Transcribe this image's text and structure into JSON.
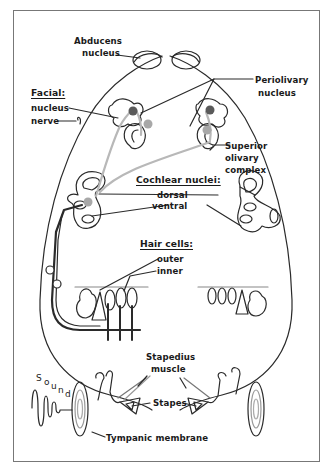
{
  "diagram": {
    "labels": {
      "abducens": [
        "Abducens",
        "nucleus"
      ],
      "facial_header": "Facial:",
      "facial_nucleus": "nucleus",
      "facial_nerve": "nerve",
      "periolivary": [
        "Periolivary",
        "nucleus"
      ],
      "superior_olivary": [
        "Superior",
        "olivary",
        "complex"
      ],
      "cochlear_header": "Cochlear nuclei:",
      "dorsal": "dorsal",
      "ventral": "ventral",
      "hair_header": "Hair cells:",
      "outer": "outer",
      "inner": "inner",
      "stapedius": [
        "Stapedius",
        "muscle"
      ],
      "stapes": "Stapes",
      "tympanic": "Tympanic membrane",
      "sound": [
        "S",
        "o",
        "u",
        "n",
        "d"
      ]
    },
    "colors": {
      "line": "#2a2a2a",
      "gray_path": "#b8b8b8",
      "dark_dot": "#5a5a5a",
      "gray_dot": "#a8a8a8",
      "frame": "#777777"
    }
  }
}
